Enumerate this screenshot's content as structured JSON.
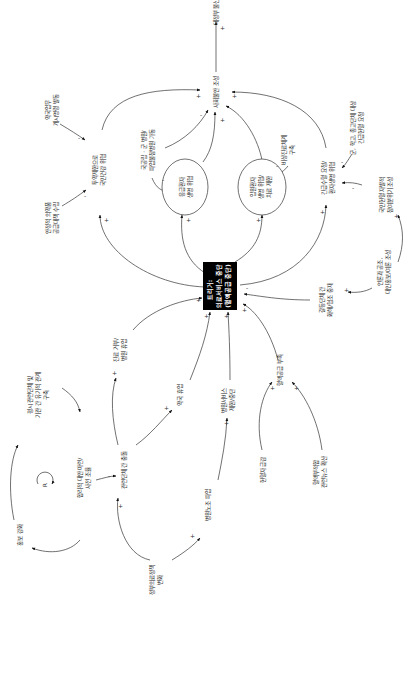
{
  "diagram": {
    "type": "causal-loop",
    "orientation": "rotated-90-ccw",
    "trigger": {
      "lines": [
        "트리거:",
        "의료서비스 중단",
        "(혈액공급 중단)"
      ],
      "bg": "#000000",
      "fg": "#ffffff"
    },
    "nodes": {
      "social_anxiety": "사회불안 조성",
      "gov_distrust": "대정부 불신",
      "drug_misuse": [
        "투약제한으로",
        "국민건강 위협"
      ],
      "emergency_risk": [
        "응급환자",
        "생명 위협"
      ],
      "inpatient_risk": [
        "입원환자",
        "생명 위협/",
        "치료 제한"
      ],
      "urgent_surgery": [
        "긴급수혈 요청/",
        "환자생명 위협"
      ],
      "pharma_order": [
        "약국업무",
        "개시명령 발동"
      ],
      "stable_supply": [
        "안정적 의약품",
        "공급대책 수립"
      ],
      "public_hospital": [
        "국공립 · 군 병원/",
        "파업불참병원 가동"
      ],
      "emergency_system": [
        "비상진료체계",
        "구축"
      ],
      "school_request": [
        "군, 학교, 종교단체 대상",
        "긴급헌혈 요청"
      ],
      "citizen_campaign": [
        "국민헌혈 자발적",
        "참여분위기 조성"
      ],
      "media_coop": [
        "언론과 공조,",
        "대인홍보/여론 조성"
      ],
      "org_dialogue": [
        "갈등단체 간",
        "화해/협조 중재"
      ],
      "refuse_treatment": [
        "진료 거부/",
        "병원 휴업"
      ],
      "pharmacy_closure": "약국 휴업",
      "hospital_service": [
        "병원서비스",
        "제한/중단"
      ],
      "blood_shortage": "혈액공급 부족",
      "blood_ban": "헌혈자 급감",
      "blood_scandal": [
        "혈액부적합",
        "관련뉴스 확산"
      ],
      "stakeholder_conflict": "관련단체 간 충돌",
      "rational_plan": [
        "합리적 대안 마련/",
        "사전 조율"
      ],
      "regular_network": [
        "평시 관련단체 및",
        "기관 간 유기적 관계",
        "구축"
      ],
      "pr_strengthen": "홍보 강화",
      "loop_label": "R",
      "union_strike": "병원노조 파업",
      "policy_change": [
        "정부의료정책",
        "변화"
      ]
    },
    "polarity": {
      "plus": "+",
      "minus": "-"
    }
  }
}
